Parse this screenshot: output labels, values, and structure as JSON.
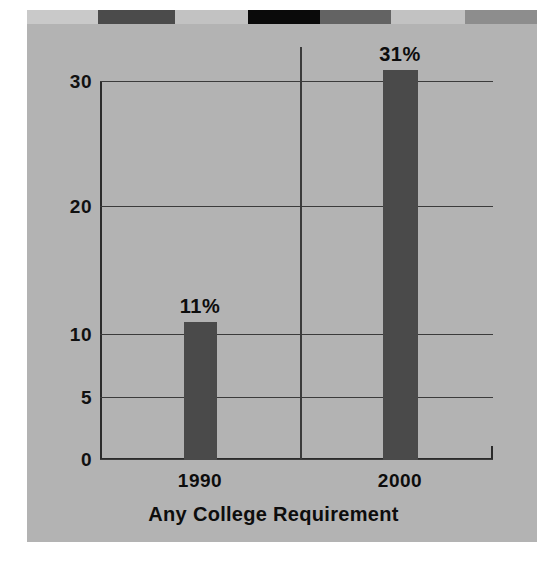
{
  "figure": {
    "background_color": "#ffffff",
    "panel_color": "#b3b3b3",
    "bar_color": "#4a4a4a",
    "gridline_color": "#3b3b3b",
    "axis_color": "#2b2b2b",
    "text_color": "#0d0d0d"
  },
  "decor": {
    "name": "top-color-strip",
    "segments": [
      {
        "color": "#c9c9c9",
        "width_pct": 14.0
      },
      {
        "color": "#4b4b4b",
        "width_pct": 15.0
      },
      {
        "color": "#c2c2c2",
        "width_pct": 14.3
      },
      {
        "color": "#0a0a0a",
        "width_pct": 14.1
      },
      {
        "color": "#636363",
        "width_pct": 14.0
      },
      {
        "color": "#c2c2c2",
        "width_pct": 14.5
      },
      {
        "color": "#8d8d8d",
        "width_pct": 14.1
      }
    ]
  },
  "chart_data": {
    "type": "bar",
    "title": "",
    "subtitle": "",
    "xlabel": "Any College Requirement",
    "ylabel": "",
    "categories": [
      "1990",
      "2000"
    ],
    "values": [
      11,
      31
    ],
    "data_labels": [
      "11%",
      "31%"
    ],
    "series": [
      {
        "name": "Any College Requirement",
        "values": [
          11,
          31
        ]
      }
    ],
    "ylim": [
      0,
      31.8
    ],
    "ytick_values": [
      0,
      5,
      10,
      20,
      30
    ],
    "ytick_labels": [
      "0",
      "5",
      "10",
      "20",
      "30"
    ],
    "grid": true,
    "grid_axis": "y",
    "legend": false,
    "legend_position": "none",
    "annotations": [
      {
        "text": "11%",
        "category": "1990",
        "value": 11
      },
      {
        "text": "31%",
        "category": "2000",
        "value": 31
      }
    ]
  }
}
